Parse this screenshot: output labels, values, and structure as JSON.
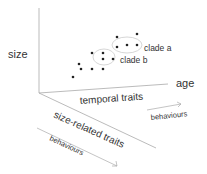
{
  "diagram": {
    "axes": {
      "vertical_label": "size",
      "horizontal_label": "age",
      "temporal_label": "temporal traits",
      "size_related_label": "size-related traits",
      "behaviours_upper": "behaviours",
      "behaviours_lower": "behaviours"
    },
    "clusters": [
      {
        "label": "clade a"
      },
      {
        "label": "clade b"
      }
    ],
    "colors": {
      "axis": "#aaaaaa",
      "dot": "#222222",
      "ellipse": "#cccccc",
      "text": "#333333"
    }
  }
}
